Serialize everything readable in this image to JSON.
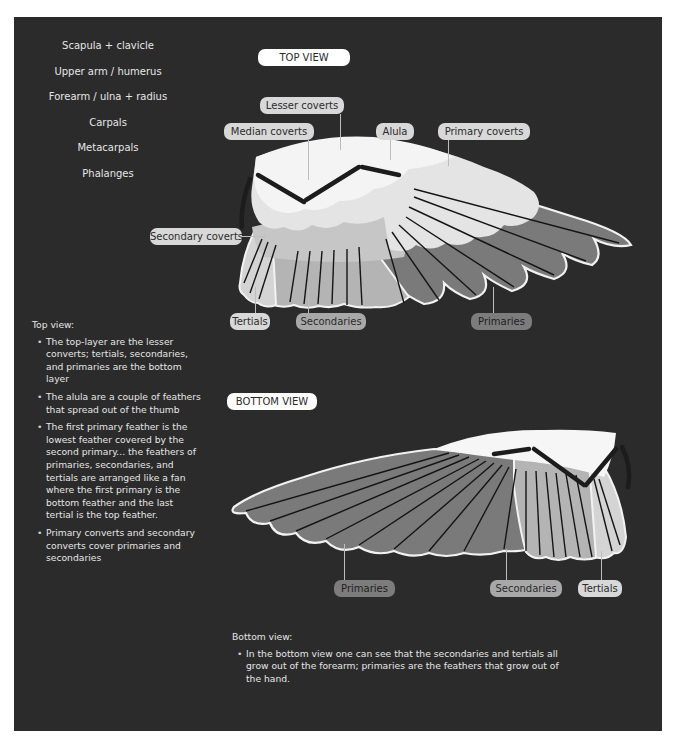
{
  "bone_labels": [
    "Scapula + clavicle",
    "Upper arm / humerus",
    "Forearm / ulna + radius",
    "Carpals",
    "Metacarpals",
    "Phalanges"
  ],
  "top_view": {
    "title": "TOP VIEW",
    "labels": {
      "lesser_coverts": "Lesser coverts",
      "median_coverts": "Median coverts",
      "alula": "Alula",
      "primary_coverts": "Primary coverts",
      "secondary_coverts": "Secondary coverts",
      "tertials": "Tertials",
      "secondaries": "Secondaries",
      "primaries": "Primaries"
    },
    "notes": {
      "heading": "Top view:",
      "items": [
        "The top-layer are the lesser converts; tertials, secondaries, and primaries are the bottom layer",
        "The alula are a couple of feathers that spread out of the thumb",
        "The first primary feather is the lowest feather covered by the second primary... the feathers of primaries, secondaries, and tertials are arranged like a fan where the first primary is the bottom feather and the last tertial is the top feather.",
        "Primary converts and secondary converts cover primaries and secondaries"
      ]
    }
  },
  "bottom_view": {
    "title": "BOTTOM VIEW",
    "labels": {
      "primaries": "Primaries",
      "secondaries": "Secondaries",
      "tertials": "Tertials"
    },
    "notes": {
      "heading": "Bottom view:",
      "items": [
        "In the bottom view one can see that the secondaries and tertials all grow out of the forearm; primaries are the feathers that grow out of the hand."
      ]
    }
  },
  "colors": {
    "background": "#2b2b2b",
    "page": "#ffffff",
    "text": "#e6e6e6",
    "pill_white": "#ffffff",
    "pill_light": "#d8d8d8",
    "pill_mid": "#a8a8a8",
    "pill_dark": "#7c7c7c",
    "primaries_fill": "#7a7a7a",
    "secondaries_fill": "#b4b4b4",
    "tertials_fill": "#d2d2d2",
    "coverts_fill": "#e8e8e8",
    "bone": "#1c1c1c"
  }
}
